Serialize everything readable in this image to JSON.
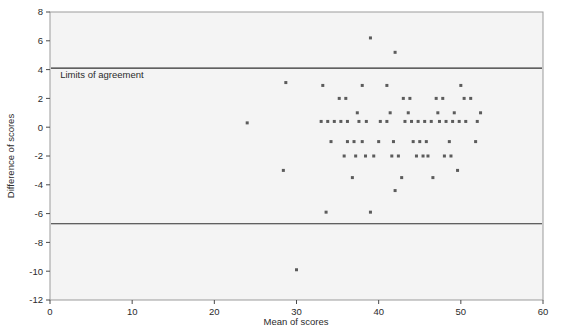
{
  "chart_data": {
    "type": "scatter",
    "title": "",
    "xlabel": "Mean of scores",
    "ylabel": "Difference of scores",
    "xlim": [
      0,
      60
    ],
    "ylim": [
      -12,
      8
    ],
    "xticks": [
      0,
      10,
      20,
      30,
      40,
      50,
      60
    ],
    "yticks": [
      8,
      6,
      4,
      2,
      0,
      -2,
      -4,
      -6,
      -8,
      -10,
      -12
    ],
    "xtick_labels": [
      "0",
      "10",
      "20",
      "30",
      "40",
      "50",
      "60"
    ],
    "ytick_labels": [
      "8",
      "6",
      "4",
      "2",
      "0",
      "-2",
      "-4",
      "-6",
      "-8",
      "-10",
      "-12"
    ],
    "grid": false,
    "legend": null,
    "annotations": [
      {
        "text": "Limits of agreement",
        "x": 1.0,
        "y": 3.4
      }
    ],
    "reference_lines": [
      {
        "name": "upper-limit-of-agreement",
        "y": 4.1,
        "orientation": "horizontal"
      },
      {
        "name": "lower-limit-of-agreement",
        "y": -6.7,
        "orientation": "horizontal"
      }
    ],
    "marker": {
      "shape": "square",
      "size": 3,
      "color": "#5b5b5b"
    },
    "points": [
      [
        24.0,
        0.3
      ],
      [
        28.7,
        3.1
      ],
      [
        28.4,
        -3.0
      ],
      [
        30.0,
        -9.9
      ],
      [
        33.2,
        2.9
      ],
      [
        33.0,
        0.4
      ],
      [
        33.8,
        0.4
      ],
      [
        34.6,
        0.4
      ],
      [
        35.4,
        0.4
      ],
      [
        36.2,
        0.4
      ],
      [
        34.2,
        -1.0
      ],
      [
        33.6,
        -5.9
      ],
      [
        35.2,
        2.0
      ],
      [
        36.0,
        2.0
      ],
      [
        36.2,
        -1.0
      ],
      [
        37.0,
        -1.0
      ],
      [
        35.8,
        -2.0
      ],
      [
        37.2,
        -2.0
      ],
      [
        36.8,
        -3.5
      ],
      [
        37.4,
        1.0
      ],
      [
        37.6,
        0.4
      ],
      [
        38.5,
        0.4
      ],
      [
        38.0,
        2.9
      ],
      [
        38.0,
        -1.0
      ],
      [
        38.4,
        -2.0
      ],
      [
        39.4,
        -2.0
      ],
      [
        39.0,
        6.2
      ],
      [
        39.0,
        -5.9
      ],
      [
        40.0,
        -1.0
      ],
      [
        40.2,
        0.4
      ],
      [
        41.0,
        0.4
      ],
      [
        41.4,
        1.0
      ],
      [
        41.0,
        2.9
      ],
      [
        42.0,
        5.2
      ],
      [
        41.8,
        -1.0
      ],
      [
        41.6,
        -2.0
      ],
      [
        42.4,
        -2.0
      ],
      [
        42.8,
        -3.5
      ],
      [
        42.0,
        -4.4
      ],
      [
        43.0,
        2.0
      ],
      [
        43.8,
        2.0
      ],
      [
        43.2,
        0.4
      ],
      [
        44.0,
        0.4
      ],
      [
        44.8,
        0.4
      ],
      [
        45.6,
        0.4
      ],
      [
        46.4,
        0.4
      ],
      [
        43.6,
        1.0
      ],
      [
        44.2,
        -1.0
      ],
      [
        45.0,
        -1.0
      ],
      [
        45.8,
        -1.0
      ],
      [
        44.6,
        -2.0
      ],
      [
        45.4,
        -2.0
      ],
      [
        46.0,
        -2.0
      ],
      [
        46.6,
        -3.5
      ],
      [
        47.2,
        1.0
      ],
      [
        47.0,
        2.0
      ],
      [
        47.8,
        2.0
      ],
      [
        47.4,
        0.4
      ],
      [
        48.2,
        0.4
      ],
      [
        49.0,
        0.4
      ],
      [
        49.8,
        0.4
      ],
      [
        50.6,
        0.4
      ],
      [
        50.0,
        2.9
      ],
      [
        49.2,
        1.0
      ],
      [
        48.6,
        -1.0
      ],
      [
        48.0,
        -2.0
      ],
      [
        48.8,
        -2.0
      ],
      [
        49.6,
        -3.0
      ],
      [
        50.4,
        2.0
      ],
      [
        51.2,
        2.0
      ],
      [
        52.0,
        0.4
      ],
      [
        51.8,
        -1.0
      ],
      [
        52.4,
        1.0
      ]
    ]
  }
}
